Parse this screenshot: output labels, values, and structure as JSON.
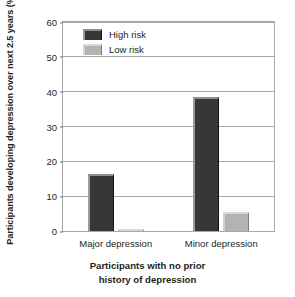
{
  "chart_data": {
    "type": "bar",
    "title": "",
    "xlabel": "Participants with no prior history of depression",
    "xlabel_line1": "Participants with no prior",
    "xlabel_line2": "history of depression",
    "ylabel": "Participants developing depression over next 2.5 years (%)",
    "categories": [
      "Major depression",
      "Minor depression"
    ],
    "series": [
      {
        "name": "High risk",
        "color": "#373737",
        "values": [
          16.5,
          38.5
        ]
      },
      {
        "name": "Low risk",
        "color": "#b3b3b3",
        "values": [
          0.5,
          5.5
        ]
      }
    ],
    "ylim": [
      0,
      60
    ],
    "yticks": [
      0,
      10,
      20,
      30,
      40,
      50,
      60
    ],
    "ytick_labels": [
      "0",
      "10",
      "20",
      "30",
      "40",
      "50",
      "60"
    ],
    "grid": true,
    "legend_position": "top-left"
  }
}
